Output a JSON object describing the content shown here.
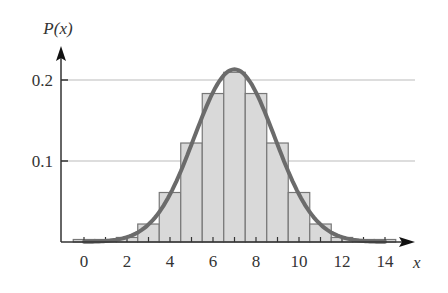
{
  "chart_data": {
    "type": "bar",
    "title": "",
    "xlabel": "x",
    "ylabel": "P(x)",
    "categories": [
      0,
      1,
      2,
      3,
      4,
      5,
      6,
      7,
      8,
      9,
      10,
      11,
      12,
      13,
      14
    ],
    "values": [
      6e-05,
      0.00085,
      0.0056,
      0.0222,
      0.0611,
      0.1222,
      0.1833,
      0.2095,
      0.1833,
      0.1222,
      0.0611,
      0.0222,
      0.0056,
      0.00085,
      6e-05
    ],
    "overlay_curve": {
      "type": "line",
      "description": "normal approximation",
      "mean": 7,
      "sd": 1.8708,
      "peak": 0.2132
    },
    "xticks": [
      0,
      1,
      2,
      3,
      4,
      5,
      6,
      7,
      8,
      9,
      10,
      11,
      12,
      13,
      14
    ],
    "xtick_labels": [
      "0",
      "2",
      "4",
      "6",
      "8",
      "10",
      "12",
      "14"
    ],
    "xtick_label_values": [
      0,
      2,
      4,
      6,
      8,
      10,
      12,
      14
    ],
    "yticks": [
      0.1,
      0.2
    ],
    "ytick_labels": [
      "0.1",
      "0.2"
    ],
    "ylim": [
      0,
      0.24
    ],
    "xlim": [
      -1,
      15
    ],
    "grid": "horizontal at y ticks",
    "legend": null
  },
  "colors": {
    "bar_fill": "#d9d9d9",
    "bar_edge": "#777777",
    "curve": "#6b6b6b",
    "axis": "#333333",
    "grid": "#bbbbbb",
    "text": "#333333"
  }
}
